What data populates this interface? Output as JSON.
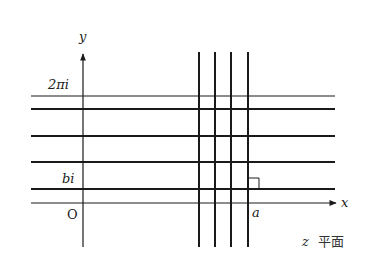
{
  "diagram": {
    "title": "z 平面",
    "plane_var": "z",
    "plane_word": "平面",
    "axes": {
      "x_label": "x",
      "y_label": "y",
      "origin_label": "O"
    },
    "labels": {
      "two_pi_i": "2πi",
      "bi": "bi",
      "a": "a"
    },
    "colors": {
      "line": "#1a1a1a",
      "background": "#ffffff"
    },
    "horizontal_lines_y": [
      96,
      109,
      136,
      162,
      189
    ],
    "vertical_lines_x": [
      199,
      215,
      231,
      248
    ]
  }
}
